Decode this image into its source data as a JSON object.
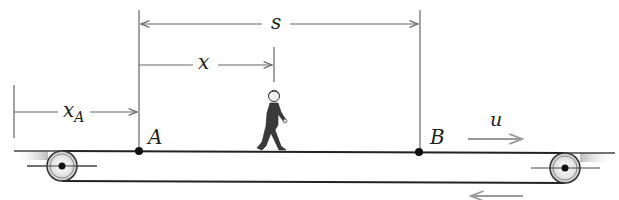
{
  "figure": {
    "labels": {
      "s": "s",
      "x": "x",
      "x_A_main": "x",
      "x_A_sub": "A",
      "point_A": "A",
      "point_B": "B",
      "belt_speed": "u"
    },
    "colors": {
      "line": "#222222",
      "dimension": "#666666",
      "arrow_gray": "#9a9a9a",
      "figure_body": "#3a3a3a"
    }
  }
}
